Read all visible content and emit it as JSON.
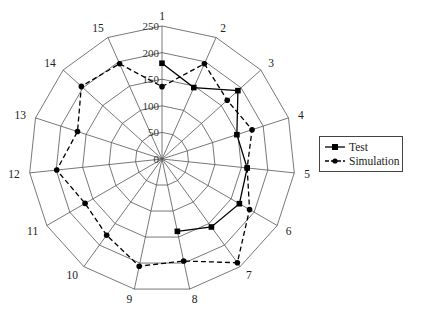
{
  "chart_data": {
    "type": "radar",
    "title": "",
    "categories": [
      "1",
      "2",
      "3",
      "4",
      "5",
      "6",
      "7",
      "8",
      "9",
      "10",
      "11",
      "12",
      "13",
      "14",
      "15"
    ],
    "radial_ticks": [
      "0",
      "50",
      "100",
      "150",
      "200",
      "250"
    ],
    "rmax": 250,
    "grid": true,
    "legend_position": "right",
    "series": [
      {
        "name": "Test",
        "marker": "square",
        "line": "solid",
        "values": [
          180,
          147,
          192,
          148,
          161,
          168,
          158,
          139,
          null,
          null,
          null,
          null,
          null,
          null,
          null
        ]
      },
      {
        "name": "Simulation",
        "marker": "circle",
        "line": "dashed",
        "values": [
          136,
          196,
          165,
          178,
          161,
          190,
          241,
          196,
          206,
          177,
          167,
          199,
          167,
          204,
          196
        ]
      }
    ]
  },
  "legend": {
    "items": [
      {
        "label": "Test"
      },
      {
        "label": "Simulation"
      }
    ]
  }
}
